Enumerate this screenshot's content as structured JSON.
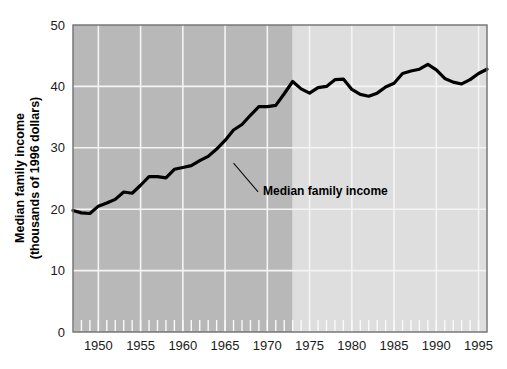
{
  "chart_data": {
    "type": "line",
    "title": "",
    "xlabel": "",
    "ylabel": "Median family income",
    "ylabel_line1": "Median family income",
    "ylabel_line2": "(thousands of 1996 dollars)",
    "ylim": [
      0,
      50
    ],
    "xlim": [
      1947,
      1996
    ],
    "grid": true,
    "legend_position": "none",
    "y_ticks": [
      "0",
      "10",
      "20",
      "30",
      "40",
      "50"
    ],
    "y_tick_values": [
      0,
      10,
      20,
      30,
      40,
      50
    ],
    "x_ticks": [
      "1950",
      "1955",
      "1960",
      "1965",
      "1970",
      "1975",
      "1980",
      "1985",
      "1990",
      "1995"
    ],
    "x_tick_values": [
      1950,
      1955,
      1960,
      1965,
      1970,
      1975,
      1980,
      1985,
      1990,
      1995
    ],
    "x_minor_tick_interval": 1,
    "annotations": [
      {
        "text": "Median family income",
        "x": 1966,
        "y": 27.5,
        "label_x": 1969.5,
        "label_y": 23.0
      }
    ],
    "shaded_regions": [
      {
        "from": 1947,
        "to": 1973,
        "color": "#b8b8b8",
        "note": "pre-1973 period"
      },
      {
        "from": 1973,
        "to": 1996,
        "color": "#dedede",
        "note": "post-1973 period"
      }
    ],
    "series": [
      {
        "name": "Median family income",
        "color": "#000000",
        "x": [
          1947,
          1948,
          1949,
          1950,
          1951,
          1952,
          1953,
          1954,
          1955,
          1956,
          1957,
          1958,
          1959,
          1960,
          1961,
          1962,
          1963,
          1964,
          1965,
          1966,
          1967,
          1968,
          1969,
          1970,
          1971,
          1972,
          1973,
          1974,
          1975,
          1976,
          1977,
          1978,
          1979,
          1980,
          1981,
          1982,
          1983,
          1984,
          1985,
          1986,
          1987,
          1988,
          1989,
          1990,
          1991,
          1992,
          1993,
          1994,
          1995,
          1996
        ],
        "values": [
          19.8,
          19.4,
          19.3,
          20.5,
          21.0,
          21.6,
          22.8,
          22.6,
          23.9,
          25.3,
          25.3,
          25.1,
          26.5,
          26.8,
          27.1,
          27.9,
          28.6,
          29.8,
          31.2,
          32.9,
          33.8,
          35.3,
          36.7,
          36.7,
          36.9,
          38.8,
          40.8,
          39.6,
          38.9,
          39.8,
          40.0,
          41.1,
          41.2,
          39.5,
          38.7,
          38.4,
          38.9,
          39.9,
          40.5,
          42.1,
          42.5,
          42.8,
          43.6,
          42.7,
          41.3,
          40.7,
          40.4,
          41.1,
          42.1,
          42.8
        ]
      }
    ]
  },
  "figure": {
    "background_color": "#ffffff",
    "plot_border_color": "#6e6e6e",
    "gridline_color": "#f2f2f2",
    "line_color": "#000000",
    "line_width": 3.2
  }
}
